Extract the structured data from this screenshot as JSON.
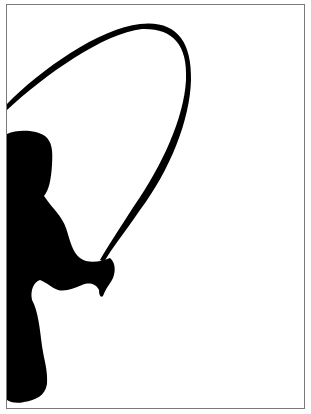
{
  "image": {
    "subject": "silhouette of a child jumping rope",
    "colors": {
      "background": "#ffffff",
      "silhouette": "#000000",
      "border": "#7a7a7a"
    }
  }
}
